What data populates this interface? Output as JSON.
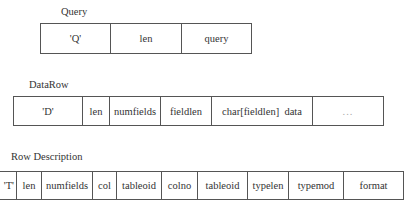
{
  "query": {
    "title": "Query",
    "fields": [
      "'Q'",
      "len",
      "query"
    ]
  },
  "data_row": {
    "title": "DataRow",
    "fields": [
      "'D'",
      "len",
      "numfields",
      "fieldlen",
      "char[fieldlen]  data",
      "..."
    ]
  },
  "row_description": {
    "title": "Row Description",
    "fields": [
      "'T'",
      "len",
      "numfields",
      "col",
      "tableoid",
      "colno",
      "tableoid",
      "typelen",
      "typemod",
      "format"
    ]
  }
}
